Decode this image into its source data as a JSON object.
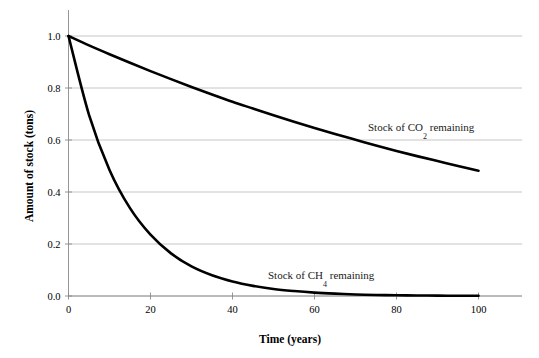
{
  "chart_data": {
    "type": "line",
    "title": "",
    "xlabel": "Time (years)",
    "ylabel": "Amount of stock (tons)",
    "xlim": [
      0,
      100
    ],
    "ylim": [
      0.0,
      1.0
    ],
    "xticks": [
      0,
      20,
      40,
      60,
      80,
      100
    ],
    "xtick_labels": [
      "0",
      "20",
      "40",
      "60",
      "80",
      "100"
    ],
    "yticks": [
      0.0,
      0.2,
      0.4,
      0.6,
      0.8,
      1.0
    ],
    "ytick_labels": [
      "0.0",
      "0.2",
      "0.4",
      "0.6",
      "0.8",
      "1.0"
    ],
    "grid": "horizontal",
    "legend": "inline-annotations",
    "series": [
      {
        "name": "Stock of CO2 remaining",
        "annotation_text": "Stock of CO",
        "annotation_subscript": "2",
        "annotation_suffix": " remaining",
        "color": "#000000",
        "decay_rate": 0.0073,
        "x": [
          0,
          5,
          10,
          15,
          20,
          25,
          30,
          35,
          40,
          45,
          50,
          55,
          60,
          65,
          70,
          75,
          80,
          85,
          90,
          95,
          100
        ],
        "values": [
          1.0,
          0.964,
          0.93,
          0.897,
          0.865,
          0.834,
          0.804,
          0.775,
          0.747,
          0.721,
          0.695,
          0.67,
          0.646,
          0.623,
          0.601,
          0.579,
          0.558,
          0.538,
          0.519,
          0.5,
          0.482
        ]
      },
      {
        "name": "Stock of CH4 remaining",
        "annotation_text": "Stock of CH",
        "annotation_subscript": "4",
        "annotation_suffix": " remaining",
        "color": "#000000",
        "decay_rate": 0.0723,
        "x": [
          0,
          5,
          10,
          15,
          20,
          25,
          30,
          35,
          40,
          45,
          50,
          55,
          60,
          65,
          70,
          75,
          80,
          85,
          90,
          95,
          100
        ],
        "values": [
          1.0,
          0.697,
          0.485,
          0.338,
          0.236,
          0.164,
          0.114,
          0.08,
          0.056,
          0.039,
          0.027,
          0.019,
          0.013,
          0.009,
          0.006,
          0.004,
          0.003,
          0.002,
          0.0015,
          0.001,
          0.0007
        ]
      }
    ],
    "annotations": [
      {
        "text": "Stock of CO2 remaining",
        "x": 82,
        "y": 0.62
      },
      {
        "text": "Stock of CH4 remaining",
        "x": 50,
        "y": 0.1
      }
    ],
    "colors": {
      "background": "#ffffff",
      "gridline": "#b8b8b8",
      "axis": "#8a8a8a",
      "curve": "#000000",
      "text": "#000000"
    }
  }
}
